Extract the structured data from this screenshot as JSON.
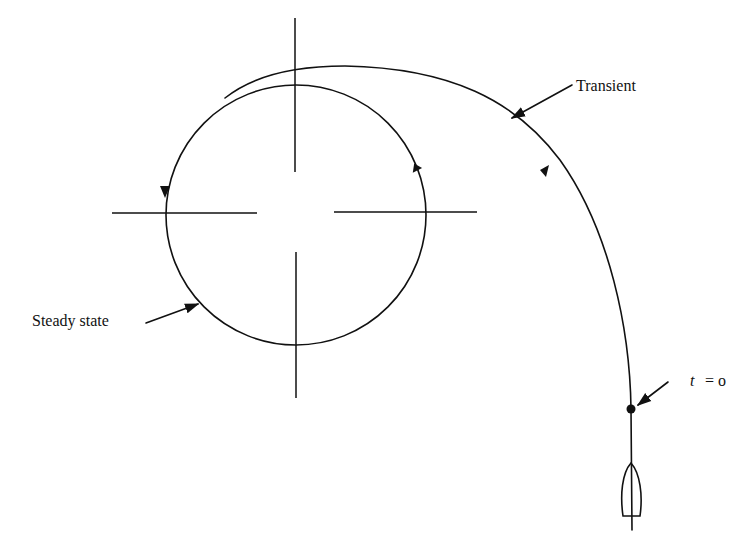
{
  "diagram": {
    "type": "ship turning circle trajectory",
    "labels": {
      "transient": "Transient",
      "steady_state": "Steady state",
      "t_var": "t",
      "t_eq": "= o"
    },
    "elements": [
      {
        "name": "steady-state-circle",
        "shape": "circle",
        "center": [
          296,
          215
        ],
        "radius": 130
      },
      {
        "name": "transient-path",
        "shape": "curve",
        "from": "ship start point",
        "to": "circle tangent near top-left"
      },
      {
        "name": "crosshair",
        "shape": "cross",
        "center": [
          296,
          215
        ]
      },
      {
        "name": "ship",
        "shape": "hull outline",
        "position": [
          631,
          490
        ]
      },
      {
        "name": "start-point",
        "shape": "dot",
        "position": [
          631,
          409
        ]
      }
    ],
    "colors": {
      "line": "#111111",
      "background": "#ffffff"
    }
  }
}
